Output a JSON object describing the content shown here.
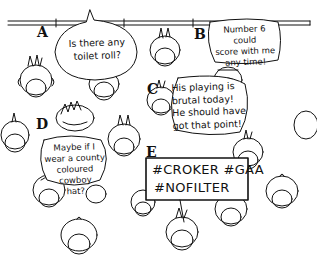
{
  "scene": {
    "description": "Hand-drawn top-down cartoon of spectators in a stand",
    "line_color": "#111111",
    "background": "#ffffff"
  },
  "labels": {
    "a": "A",
    "b": "B",
    "c": "C",
    "d": "D",
    "e": "E"
  },
  "bubbles": {
    "a": {
      "lines": [
        "Is there any",
        "toilet roll?"
      ]
    },
    "b": {
      "lines": [
        "Number 6 could",
        "score with me",
        "any time!"
      ]
    },
    "c": {
      "lines": [
        "His playing is",
        "brutal today!",
        "He should have",
        "got that point!"
      ]
    },
    "d": {
      "lines": [
        "Maybe if I",
        "wear a county",
        "coloured cowboy",
        "hat?"
      ]
    }
  },
  "sign": {
    "lines": [
      "#CROKER #GAA",
      "#NOFILTER"
    ]
  }
}
